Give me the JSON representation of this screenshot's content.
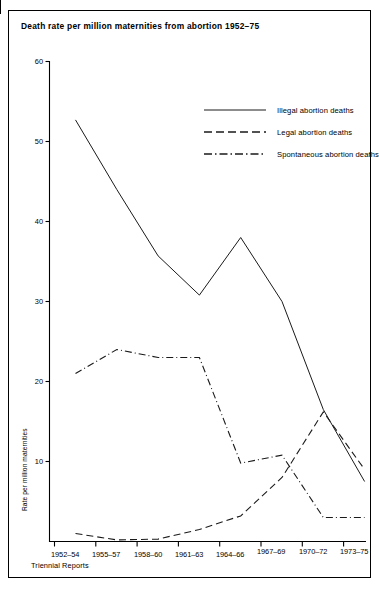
{
  "figure": {
    "title": "Death rate per million maternities from abortion 1952–75"
  },
  "chart_data": {
    "type": "line",
    "title": "Death rate per million maternities from abortion 1952–75",
    "xlabel": "Triennial Reports",
    "ylabel": "Rate per million maternities",
    "categories": [
      "1952–54",
      "1955–57",
      "1958–60",
      "1961–63",
      "1964–66",
      "1967–69",
      "1970–72",
      "1973–75"
    ],
    "ylim": [
      0,
      60
    ],
    "yticks": [
      60,
      50,
      40,
      30,
      20,
      10
    ],
    "grid": false,
    "legend_position": "top-right",
    "series": [
      {
        "name": "Illegal abortion deaths",
        "style": "solid",
        "values": [
          52.7,
          44.0,
          35.7,
          30.8,
          38.0,
          30.0,
          16.5,
          7.5
        ]
      },
      {
        "name": "Legal abortion deaths",
        "style": "dashed",
        "values": [
          1.0,
          0.2,
          0.3,
          1.5,
          3.2,
          8.0,
          16.2,
          9.0
        ]
      },
      {
        "name": "Spontaneous abortion deaths",
        "style": "dash-dot",
        "values": [
          21.0,
          24.0,
          23.0,
          23.0,
          9.8,
          10.8,
          3.0,
          3.0
        ]
      }
    ]
  },
  "axis": {
    "y_ticks": [
      "60",
      "50",
      "40",
      "30",
      "20",
      "10"
    ],
    "x_ticks": [
      "1952–54",
      "1955–57",
      "1958–60",
      "1961–63",
      "1964–66",
      "1967–69",
      "1970–72",
      "1973–75"
    ],
    "y_title": "Rate per million maternities",
    "x_title": "Triennial Reports"
  },
  "legend": {
    "items": [
      {
        "label": "Illegal abortion deaths",
        "style": "solid"
      },
      {
        "label": "Legal abortion deaths",
        "style": "dashed"
      },
      {
        "label": "Spontaneous abortion deaths",
        "style": "dash-dot"
      }
    ]
  }
}
